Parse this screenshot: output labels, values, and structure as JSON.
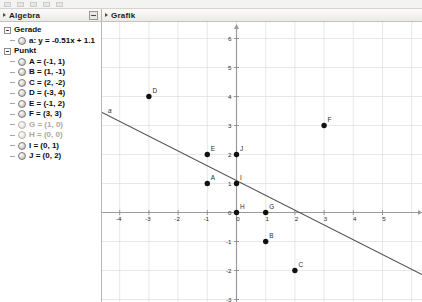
{
  "window": {
    "toolbar_icons": [
      "tool-icon-1",
      "tool-icon-2",
      "tool-icon-3",
      "tool-icon-4",
      "tool-icon-5"
    ]
  },
  "algebra_panel": {
    "title": "Algebra",
    "collapse_button": "minimize-button",
    "groups": [
      {
        "name": "Gerade",
        "items": [
          {
            "label": "a: y = -0.51x + 1.1",
            "hidden": false
          }
        ]
      },
      {
        "name": "Punkt",
        "items": [
          {
            "label": "A = (-1, 1)",
            "hidden": false
          },
          {
            "label": "B = (1, -1)",
            "hidden": false
          },
          {
            "label": "C = (2, -2)",
            "hidden": false
          },
          {
            "label": "D = (-3, 4)",
            "hidden": false
          },
          {
            "label": "E = (-1, 2)",
            "hidden": false
          },
          {
            "label": "F = (3, 3)",
            "hidden": false
          },
          {
            "label": "G = (1, 0)",
            "hidden": true
          },
          {
            "label": "H = (0, 0)",
            "hidden": true
          },
          {
            "label": "I = (0, 1)",
            "hidden": false
          },
          {
            "label": "J = (0, 2)",
            "hidden": false
          }
        ]
      }
    ]
  },
  "graphics_panel": {
    "title": "Grafik"
  },
  "chart_data": {
    "type": "scatter",
    "title": "Grafik",
    "xlabel": "x",
    "ylabel": "y",
    "xlim": [
      -4.6,
      6.4
    ],
    "ylim": [
      -3.4,
      6.3
    ],
    "grid": true,
    "x_ticks": [
      -4,
      -3,
      -2,
      -1,
      0,
      1,
      2,
      3,
      4,
      5
    ],
    "y_ticks": [
      -3,
      -2,
      -1,
      0,
      1,
      2,
      3,
      4,
      5,
      6
    ],
    "points": [
      {
        "name": "A",
        "x": -1,
        "y": 1
      },
      {
        "name": "B",
        "x": 1,
        "y": -1
      },
      {
        "name": "C",
        "x": 2,
        "y": -2
      },
      {
        "name": "D",
        "x": -3,
        "y": 4
      },
      {
        "name": "E",
        "x": -1,
        "y": 2
      },
      {
        "name": "F",
        "x": 3,
        "y": 3
      },
      {
        "name": "G",
        "x": 1,
        "y": 0
      },
      {
        "name": "H",
        "x": 0,
        "y": 0
      },
      {
        "name": "I",
        "x": 0,
        "y": 1
      },
      {
        "name": "J",
        "x": 0,
        "y": 2
      }
    ],
    "line": {
      "name": "a",
      "equation": "y = -0.51x + 1.1",
      "slope": -0.51,
      "intercept": 1.1,
      "color": "#4a4a4a"
    }
  }
}
